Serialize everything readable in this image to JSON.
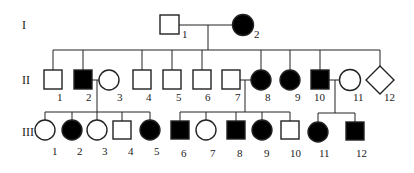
{
  "colors": {
    "affected": "#000000",
    "unaffected": "#ffffff",
    "stroke": "#222222"
  },
  "generations": [
    {
      "label": "I",
      "members": [
        {
          "id": "1",
          "sex": "male",
          "affected": false
        },
        {
          "id": "2",
          "sex": "female",
          "affected": true
        }
      ]
    },
    {
      "label": "II",
      "members": [
        {
          "id": "1",
          "sex": "male",
          "affected": false
        },
        {
          "id": "2",
          "sex": "male",
          "affected": true
        },
        {
          "id": "3",
          "sex": "female",
          "affected": false
        },
        {
          "id": "4",
          "sex": "male",
          "affected": false
        },
        {
          "id": "5",
          "sex": "male",
          "affected": false
        },
        {
          "id": "6",
          "sex": "male",
          "affected": false
        },
        {
          "id": "7",
          "sex": "male",
          "affected": false
        },
        {
          "id": "8",
          "sex": "female",
          "affected": true
        },
        {
          "id": "9",
          "sex": "female",
          "affected": true
        },
        {
          "id": "10",
          "sex": "male",
          "affected": true
        },
        {
          "id": "11",
          "sex": "female",
          "affected": false
        },
        {
          "id": "12",
          "sex": "unknown",
          "affected": false
        }
      ]
    },
    {
      "label": "III",
      "members": [
        {
          "id": "1",
          "sex": "female",
          "affected": false
        },
        {
          "id": "2",
          "sex": "female",
          "affected": true
        },
        {
          "id": "3",
          "sex": "female",
          "affected": false
        },
        {
          "id": "4",
          "sex": "male",
          "affected": false
        },
        {
          "id": "5",
          "sex": "female",
          "affected": true
        },
        {
          "id": "6",
          "sex": "male",
          "affected": true
        },
        {
          "id": "7",
          "sex": "female",
          "affected": false
        },
        {
          "id": "8",
          "sex": "male",
          "affected": true
        },
        {
          "id": "9",
          "sex": "female",
          "affected": true
        },
        {
          "id": "10",
          "sex": "male",
          "affected": false
        },
        {
          "id": "11",
          "sex": "female",
          "affected": true
        },
        {
          "id": "12",
          "sex": "male",
          "affected": true
        }
      ]
    }
  ]
}
